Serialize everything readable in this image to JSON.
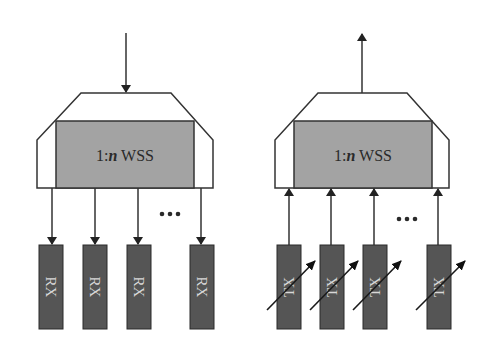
{
  "diagram": {
    "type": "block-diagram",
    "colors": {
      "outline": "#333333",
      "wss_core_fill": "#a3a3a3",
      "port_fill": "#555555",
      "port_text": "#d8d8d8",
      "background": "#ffffff"
    },
    "blocks": [
      {
        "id": "receiver-side",
        "wss_label_prefix": "1:",
        "wss_label_var": "n",
        "wss_label_suffix": " WSS",
        "direction": "drop",
        "port_label": "RX",
        "ports": [
          "RX",
          "RX",
          "RX",
          "RX"
        ],
        "ellipsis": "•••",
        "tunable": false
      },
      {
        "id": "transmitter-side",
        "wss_label_prefix": "1:",
        "wss_label_var": "n",
        "wss_label_suffix": " WSS",
        "direction": "add",
        "port_label": "TX",
        "ports": [
          "TX",
          "TX",
          "TX",
          "TX"
        ],
        "ellipsis": "•••",
        "tunable": true
      }
    ]
  }
}
